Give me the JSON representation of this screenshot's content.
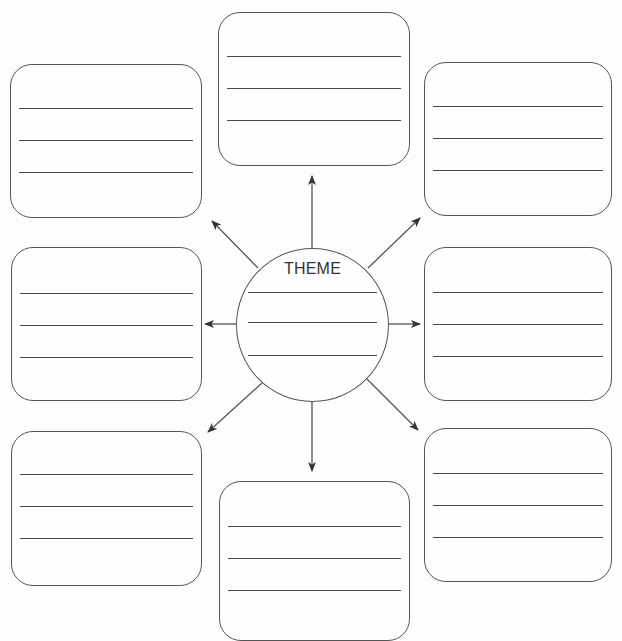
{
  "diagram": {
    "type": "theme-web-graphic-organizer",
    "center": {
      "label": "THEME",
      "writing_lines": 3
    },
    "outer_boxes": [
      {
        "position": "top-left",
        "writing_lines": 3
      },
      {
        "position": "top-center",
        "writing_lines": 3
      },
      {
        "position": "top-right",
        "writing_lines": 3
      },
      {
        "position": "middle-left",
        "writing_lines": 3
      },
      {
        "position": "middle-right",
        "writing_lines": 3
      },
      {
        "position": "bottom-left",
        "writing_lines": 3
      },
      {
        "position": "bottom-center",
        "writing_lines": 3
      },
      {
        "position": "bottom-right",
        "writing_lines": 3
      }
    ],
    "arrows": [
      {
        "from": "center",
        "to": "top-center"
      },
      {
        "from": "center",
        "to": "top-left"
      },
      {
        "from": "center",
        "to": "top-right"
      },
      {
        "from": "center",
        "to": "middle-left"
      },
      {
        "from": "center",
        "to": "middle-right"
      },
      {
        "from": "center",
        "to": "bottom-left"
      },
      {
        "from": "center",
        "to": "bottom-center"
      },
      {
        "from": "center",
        "to": "bottom-right"
      }
    ],
    "colors": {
      "stroke": "#555555",
      "line": "#4a4a4a",
      "background": "#fdfdfd",
      "text": "#333333"
    }
  }
}
